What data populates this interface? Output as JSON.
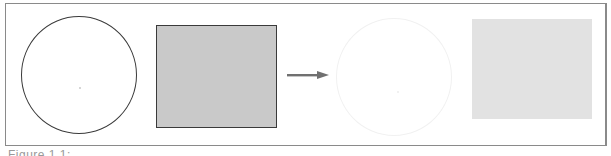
{
  "figure": {
    "panels": [
      {
        "name": "circle-outline",
        "fill": "#ffffff",
        "stroke": "#3a3a3a"
      },
      {
        "name": "gray-square",
        "fill": "#c9c9c9",
        "stroke": "#3a3a3a"
      },
      {
        "name": "arrow",
        "color": "#707070",
        "direction": "right"
      },
      {
        "name": "faint-circle",
        "fill": "#ffffff",
        "stroke": "#f1f1f1"
      },
      {
        "name": "faint-square",
        "fill": "#e2e2e2",
        "stroke": "none"
      }
    ],
    "caption": "Figure 1.1: ..."
  }
}
